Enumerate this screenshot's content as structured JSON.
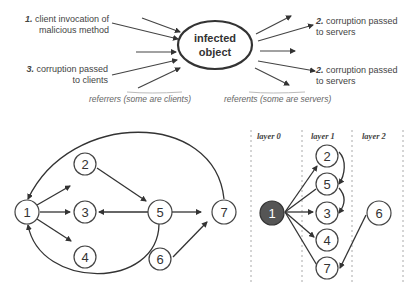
{
  "top_diagram": {
    "center_node": {
      "line1": "infected",
      "line2": "object"
    },
    "left_labels": [
      {
        "num": "1.",
        "line1": "client invocation of",
        "line2": "malicious method"
      },
      {
        "num": "3.",
        "line1": "corruption passed",
        "line2": "to clients"
      }
    ],
    "right_labels": [
      {
        "num": "2.",
        "line1": "corruption passed",
        "line2": "to servers"
      },
      {
        "num": "2.",
        "line1": "corruption passed",
        "line2": "to servers"
      }
    ],
    "left_caption": "referrers (some are clients)",
    "right_caption": "referents  (some are servers)"
  },
  "graph": {
    "nodes": [
      "1",
      "2",
      "3",
      "4",
      "5",
      "6",
      "7"
    ],
    "edges": [
      [
        "1",
        "2"
      ],
      [
        "1",
        "3"
      ],
      [
        "1",
        "4"
      ],
      [
        "2",
        "5"
      ],
      [
        "5",
        "3"
      ],
      [
        "5",
        "7"
      ],
      [
        "6",
        "7"
      ],
      [
        "7",
        "1"
      ],
      [
        "5",
        "1"
      ]
    ]
  },
  "layered_graph": {
    "layers": [
      "layer 0",
      "layer 1",
      "layer 2"
    ],
    "layer0_nodes": [
      "1"
    ],
    "layer1_nodes": [
      "2",
      "5",
      "3",
      "4",
      "7"
    ],
    "layer2_nodes": [
      "6"
    ],
    "highlight_color": "#555555"
  }
}
